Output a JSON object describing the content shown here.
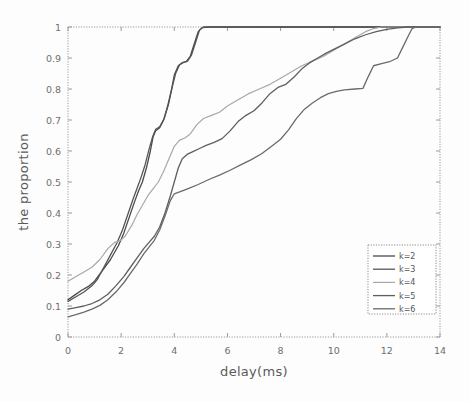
{
  "chart_data": {
    "type": "line",
    "title": "",
    "xlabel": "delay(ms)",
    "ylabel": "the proportion",
    "xlim": [
      0,
      14
    ],
    "ylim": [
      0,
      1
    ],
    "xticks": [
      0,
      2,
      4,
      6,
      8,
      10,
      12,
      14
    ],
    "xtick_labels": [
      "0",
      "2",
      "4",
      "6",
      "8",
      "10",
      "12",
      "14"
    ],
    "yticks": [
      0,
      0.1,
      0.2,
      0.3,
      0.4,
      0.5,
      0.6,
      0.7,
      0.8,
      0.9,
      1
    ],
    "ytick_labels": [
      "0",
      "0.1",
      "0.2",
      "0.3",
      "0.4",
      "0.5",
      "0.6",
      "0.7",
      "0.8",
      "0.9",
      "1"
    ],
    "grid": false,
    "legend_position": "lower right",
    "series": [
      {
        "name": "k=2",
        "color": "#4a4a4a",
        "width": 1.3,
        "points": [
          [
            0,
            0.12
          ],
          [
            0.25,
            0.135
          ],
          [
            0.5,
            0.15
          ],
          [
            0.8,
            0.165
          ],
          [
            1.0,
            0.18
          ],
          [
            1.3,
            0.215
          ],
          [
            1.6,
            0.25
          ],
          [
            1.9,
            0.295
          ],
          [
            2.1,
            0.335
          ],
          [
            2.3,
            0.385
          ],
          [
            2.5,
            0.435
          ],
          [
            2.65,
            0.47
          ],
          [
            2.8,
            0.5
          ],
          [
            2.95,
            0.545
          ],
          [
            3.1,
            0.6
          ],
          [
            3.2,
            0.645
          ],
          [
            3.3,
            0.665
          ],
          [
            3.45,
            0.675
          ],
          [
            3.6,
            0.7
          ],
          [
            3.75,
            0.745
          ],
          [
            3.9,
            0.8
          ],
          [
            4.0,
            0.845
          ],
          [
            4.15,
            0.875
          ],
          [
            4.3,
            0.885
          ],
          [
            4.45,
            0.888
          ],
          [
            4.6,
            0.905
          ],
          [
            4.75,
            0.945
          ],
          [
            4.9,
            0.985
          ],
          [
            5.05,
            0.998
          ],
          [
            5.3,
            1.0
          ],
          [
            7.0,
            1.0
          ],
          [
            10.0,
            1.0
          ],
          [
            14.0,
            1.0
          ]
        ]
      },
      {
        "name": "k=3",
        "color": "#555555",
        "width": 1.3,
        "points": [
          [
            0,
            0.115
          ],
          [
            0.3,
            0.13
          ],
          [
            0.6,
            0.145
          ],
          [
            0.9,
            0.165
          ],
          [
            1.1,
            0.185
          ],
          [
            1.35,
            0.225
          ],
          [
            1.6,
            0.265
          ],
          [
            1.85,
            0.305
          ],
          [
            2.05,
            0.345
          ],
          [
            2.25,
            0.395
          ],
          [
            2.45,
            0.445
          ],
          [
            2.6,
            0.48
          ],
          [
            2.75,
            0.515
          ],
          [
            2.9,
            0.555
          ],
          [
            3.05,
            0.605
          ],
          [
            3.18,
            0.645
          ],
          [
            3.3,
            0.67
          ],
          [
            3.45,
            0.678
          ],
          [
            3.62,
            0.705
          ],
          [
            3.78,
            0.75
          ],
          [
            3.92,
            0.805
          ],
          [
            4.05,
            0.85
          ],
          [
            4.2,
            0.878
          ],
          [
            4.35,
            0.886
          ],
          [
            4.5,
            0.89
          ],
          [
            4.65,
            0.91
          ],
          [
            4.8,
            0.95
          ],
          [
            4.95,
            0.99
          ],
          [
            5.1,
            1.0
          ],
          [
            5.4,
            1.0
          ],
          [
            8.0,
            1.0
          ],
          [
            11.0,
            1.0
          ],
          [
            14.0,
            1.0
          ]
        ]
      },
      {
        "name": "k=4",
        "color": "#a8a8a8",
        "width": 1.2,
        "points": [
          [
            0,
            0.18
          ],
          [
            0.3,
            0.195
          ],
          [
            0.6,
            0.21
          ],
          [
            0.9,
            0.225
          ],
          [
            1.2,
            0.25
          ],
          [
            1.5,
            0.285
          ],
          [
            1.75,
            0.305
          ],
          [
            1.95,
            0.31
          ],
          [
            2.15,
            0.325
          ],
          [
            2.4,
            0.36
          ],
          [
            2.6,
            0.395
          ],
          [
            2.8,
            0.425
          ],
          [
            3.0,
            0.455
          ],
          [
            3.2,
            0.478
          ],
          [
            3.4,
            0.5
          ],
          [
            3.6,
            0.535
          ],
          [
            3.8,
            0.575
          ],
          [
            4.0,
            0.615
          ],
          [
            4.2,
            0.635
          ],
          [
            4.4,
            0.642
          ],
          [
            4.6,
            0.655
          ],
          [
            4.85,
            0.685
          ],
          [
            5.1,
            0.705
          ],
          [
            5.4,
            0.715
          ],
          [
            5.7,
            0.725
          ],
          [
            6.0,
            0.745
          ],
          [
            6.4,
            0.765
          ],
          [
            6.8,
            0.785
          ],
          [
            7.2,
            0.8
          ],
          [
            7.6,
            0.815
          ],
          [
            8.0,
            0.835
          ],
          [
            8.4,
            0.855
          ],
          [
            8.8,
            0.875
          ],
          [
            9.2,
            0.89
          ],
          [
            9.6,
            0.905
          ],
          [
            10.0,
            0.925
          ],
          [
            10.4,
            0.945
          ],
          [
            10.8,
            0.965
          ],
          [
            11.2,
            0.985
          ],
          [
            11.5,
            0.995
          ],
          [
            11.8,
            1.0
          ],
          [
            12.5,
            1.0
          ],
          [
            14.0,
            1.0
          ]
        ]
      },
      {
        "name": "k=5",
        "color": "#5e5e5e",
        "width": 1.3,
        "points": [
          [
            0,
            0.09
          ],
          [
            0.3,
            0.095
          ],
          [
            0.6,
            0.1
          ],
          [
            0.9,
            0.108
          ],
          [
            1.2,
            0.12
          ],
          [
            1.5,
            0.138
          ],
          [
            1.8,
            0.165
          ],
          [
            2.1,
            0.195
          ],
          [
            2.35,
            0.225
          ],
          [
            2.6,
            0.255
          ],
          [
            2.85,
            0.285
          ],
          [
            3.05,
            0.305
          ],
          [
            3.25,
            0.325
          ],
          [
            3.45,
            0.355
          ],
          [
            3.65,
            0.4
          ],
          [
            3.85,
            0.455
          ],
          [
            4.0,
            0.5
          ],
          [
            4.15,
            0.545
          ],
          [
            4.3,
            0.575
          ],
          [
            4.5,
            0.59
          ],
          [
            4.7,
            0.598
          ],
          [
            4.95,
            0.608
          ],
          [
            5.2,
            0.618
          ],
          [
            5.5,
            0.628
          ],
          [
            5.8,
            0.64
          ],
          [
            6.1,
            0.665
          ],
          [
            6.4,
            0.695
          ],
          [
            6.7,
            0.715
          ],
          [
            7.0,
            0.73
          ],
          [
            7.3,
            0.755
          ],
          [
            7.6,
            0.785
          ],
          [
            7.9,
            0.805
          ],
          [
            8.2,
            0.815
          ],
          [
            8.5,
            0.838
          ],
          [
            8.8,
            0.865
          ],
          [
            9.1,
            0.885
          ],
          [
            9.4,
            0.9
          ],
          [
            9.7,
            0.915
          ],
          [
            10.0,
            0.928
          ],
          [
            10.4,
            0.945
          ],
          [
            10.8,
            0.962
          ],
          [
            11.2,
            0.975
          ],
          [
            11.6,
            0.985
          ],
          [
            12.0,
            0.992
          ],
          [
            12.4,
            0.997
          ],
          [
            12.8,
            1.0
          ],
          [
            14.0,
            1.0
          ]
        ]
      },
      {
        "name": "k=6",
        "color": "#6a6a6a",
        "width": 1.3,
        "points": [
          [
            0,
            0.065
          ],
          [
            0.3,
            0.072
          ],
          [
            0.6,
            0.08
          ],
          [
            0.9,
            0.09
          ],
          [
            1.2,
            0.102
          ],
          [
            1.5,
            0.12
          ],
          [
            1.8,
            0.145
          ],
          [
            2.1,
            0.175
          ],
          [
            2.35,
            0.205
          ],
          [
            2.6,
            0.235
          ],
          [
            2.85,
            0.268
          ],
          [
            3.05,
            0.29
          ],
          [
            3.25,
            0.312
          ],
          [
            3.45,
            0.345
          ],
          [
            3.65,
            0.39
          ],
          [
            3.85,
            0.44
          ],
          [
            4.0,
            0.462
          ],
          [
            4.2,
            0.468
          ],
          [
            4.5,
            0.478
          ],
          [
            4.9,
            0.492
          ],
          [
            5.3,
            0.508
          ],
          [
            5.7,
            0.522
          ],
          [
            6.1,
            0.538
          ],
          [
            6.5,
            0.555
          ],
          [
            6.9,
            0.572
          ],
          [
            7.3,
            0.592
          ],
          [
            7.7,
            0.618
          ],
          [
            8.0,
            0.638
          ],
          [
            8.3,
            0.668
          ],
          [
            8.6,
            0.705
          ],
          [
            8.9,
            0.735
          ],
          [
            9.2,
            0.755
          ],
          [
            9.5,
            0.772
          ],
          [
            9.8,
            0.785
          ],
          [
            10.1,
            0.792
          ],
          [
            10.4,
            0.797
          ],
          [
            10.8,
            0.8
          ],
          [
            11.1,
            0.802
          ],
          [
            11.3,
            0.84
          ],
          [
            11.5,
            0.875
          ],
          [
            11.8,
            0.882
          ],
          [
            12.1,
            0.888
          ],
          [
            12.4,
            0.9
          ],
          [
            12.6,
            0.935
          ],
          [
            12.8,
            0.97
          ],
          [
            12.95,
            0.995
          ],
          [
            13.1,
            1.0
          ],
          [
            14.0,
            1.0
          ]
        ]
      }
    ],
    "legend_entries": [
      "k=2",
      "k=3",
      "k=4",
      "k=5",
      "k=6"
    ]
  }
}
